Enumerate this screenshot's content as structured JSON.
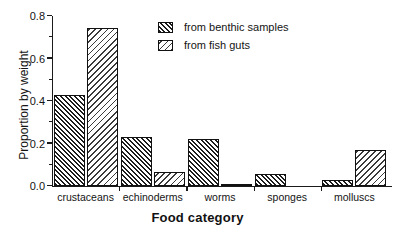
{
  "chart_data": {
    "type": "bar",
    "title": "",
    "xlabel": "Food category",
    "ylabel": "Proportion by weight",
    "categories": [
      "crustaceans",
      "echinoderms",
      "worms",
      "sponges",
      "molluscs"
    ],
    "series": [
      {
        "name": "from benthic samples",
        "values": [
          0.43,
          0.23,
          0.22,
          0.055,
          0.03
        ]
      },
      {
        "name": "from fish guts",
        "values": [
          0.745,
          0.065,
          0.005,
          0.0,
          0.17
        ]
      }
    ],
    "ylim": [
      0.0,
      0.8
    ],
    "yticks": [
      0.0,
      0.2,
      0.4,
      0.6,
      0.8
    ],
    "ytick_labels": [
      "0.0",
      "0.2",
      "0.4",
      "0.6",
      "0.8"
    ],
    "yminor_ticks": [
      0.1,
      0.3,
      0.5,
      0.7
    ],
    "grid": false,
    "legend_position": "upper-center"
  },
  "legend": {
    "items": [
      {
        "label": "from benthic samples",
        "pattern": "hatch-forward"
      },
      {
        "label": "from fish guts",
        "pattern": "hatch-backward"
      }
    ]
  },
  "axes": {
    "x_title": "Food category",
    "y_title": "Proportion by weight"
  },
  "colors": {
    "axis": "#1a1a1a",
    "text": "#141414",
    "benthic_hatch": "#1c1c1c",
    "fishguts_hatch": "#3a3a3a",
    "background": "#ffffff"
  }
}
